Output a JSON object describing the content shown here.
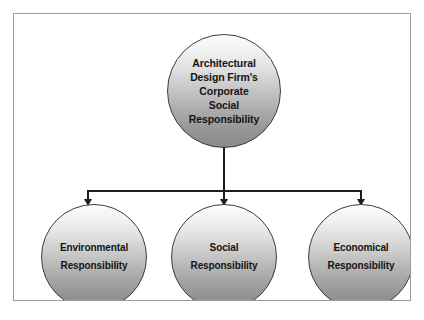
{
  "diagram": {
    "title": "Architectural Design Firm's Corporate Social Responsibility",
    "type": "hierarchy",
    "root": {
      "id": "csr-root",
      "label": "Architectural\nDesign Firm's\nCorporate\nSocial\nResponsibility"
    },
    "children": [
      {
        "id": "environmental",
        "label": "Environmental\nResponsibility"
      },
      {
        "id": "social",
        "label": "Social\nResponsibility"
      },
      {
        "id": "economical",
        "label": "Economical\nResponsibility"
      }
    ],
    "colors": {
      "node_fill_top": "#fcfcfc",
      "node_fill_bottom": "#8b8b8b",
      "node_stroke": "#3c3c3c",
      "connector": "#1e1e1e",
      "frame_border": "#9b9b9b",
      "text": "#141414",
      "background": "#ffffff"
    }
  }
}
